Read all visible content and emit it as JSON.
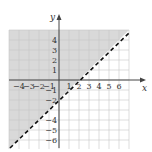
{
  "chart_data": {
    "type": "area",
    "title": "",
    "subtitle": "",
    "xlabel": "x",
    "ylabel": "y",
    "xlim": [
      -5,
      7
    ],
    "ylim": [
      -7,
      5
    ],
    "grid": true,
    "legend": null,
    "x_ticks": [
      -4,
      -3,
      -2,
      -1,
      1,
      2,
      3,
      4,
      5,
      6
    ],
    "y_ticks": [
      4,
      3,
      2,
      1,
      -1,
      -2,
      -4,
      -5,
      -6
    ],
    "series": [
      {
        "name": "boundary",
        "kind": "line",
        "style": "dashed",
        "equation": "y = x - 2",
        "x": [
          -5,
          7
        ],
        "values": [
          -7,
          5
        ]
      }
    ],
    "shaded_region": "y > x - 2",
    "annotations": []
  },
  "axis": {
    "x_label": "x",
    "y_label": "y",
    "x_tick_labels": [
      "-4",
      "-3",
      "-2",
      "-1",
      "1",
      "2",
      "3",
      "4",
      "5",
      "6"
    ],
    "y_tick_labels": [
      "4",
      "3",
      "2",
      "1",
      "-1",
      "-2",
      "-4",
      "-5",
      "-6"
    ]
  },
  "colors": {
    "shade": "#d9d9d9",
    "grid": "#c8c8c8",
    "axis": "#444444",
    "boundary": "#111111",
    "background": "#ffffff"
  }
}
